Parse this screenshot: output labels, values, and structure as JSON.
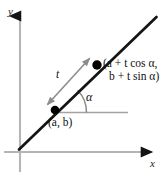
{
  "figure": {
    "type": "geometry-diagram",
    "background_color": "#ffffff"
  },
  "axes": {
    "x_label": "x",
    "y_label": "y",
    "color": "#b3b3b3",
    "arrow_color": "#1a1a1a",
    "x_axis": {
      "y": 152,
      "x_start": 4,
      "x_end": 158
    },
    "y_axis": {
      "x": 20,
      "y_start": 10,
      "y_end": 172
    }
  },
  "line": {
    "name": "parametric-line",
    "color": "#151515",
    "width": 2.6,
    "from": {
      "x": 19,
      "y": 149
    },
    "to": {
      "x": 156,
      "y": 17
    }
  },
  "points": [
    {
      "name": "point-ab",
      "label": "(a, b)",
      "cx": 55,
      "cy": 110,
      "r": 4.2,
      "color": "#000000"
    },
    {
      "name": "point-parametric",
      "label_line_1": "(a + t cos α,",
      "label_line_2": "b + t sin α)",
      "cx": 97,
      "cy": 65,
      "r": 4.6,
      "color": "#000000"
    }
  ],
  "measurements": {
    "segment_label": "t",
    "segment_color": "#8d8d8d",
    "angle_label": "α",
    "angle_arc_color": "#8a8a8a",
    "horizontal_ray_color": "#9a9a9a"
  },
  "annotations": {
    "parametric_expression_x": "a + t cos α",
    "parametric_expression_y": "b + t sin α",
    "distance_parameter": "t",
    "inclination_angle": "α"
  }
}
